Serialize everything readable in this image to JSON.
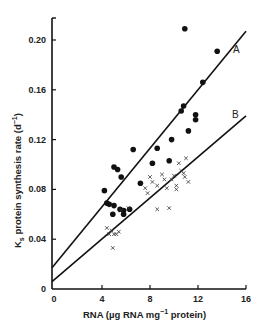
{
  "chart_data": {
    "type": "scatter",
    "title": "",
    "xlabel": "RNA (µg RNA mg⁻¹ protein)",
    "ylabel": "Ks protein synthesis rate (d⁻¹)",
    "xlim": [
      0,
      16
    ],
    "ylim": [
      0,
      0.22
    ],
    "x_ticks": [
      "0",
      "4",
      "8",
      "12",
      "16"
    ],
    "y_ticks": [
      "0",
      "0.04",
      "0.08",
      "0.12",
      "0.16",
      "0.20"
    ],
    "grid": false,
    "legend": "none",
    "series": [
      {
        "name": "dots",
        "marker": "filled-circle",
        "points": [
          [
            4.2,
            0.079
          ],
          [
            4.4,
            0.069
          ],
          [
            4.6,
            0.068
          ],
          [
            5.0,
            0.067
          ],
          [
            4.9,
            0.06
          ],
          [
            5.0,
            0.098
          ],
          [
            5.3,
            0.096
          ],
          [
            5.6,
            0.09
          ],
          [
            5.5,
            0.064
          ],
          [
            5.8,
            0.063
          ],
          [
            5.8,
            0.06
          ],
          [
            6.3,
            0.064
          ],
          [
            6.6,
            0.112
          ],
          [
            7.2,
            0.085
          ],
          [
            8.2,
            0.101
          ],
          [
            8.6,
            0.113
          ],
          [
            9.6,
            0.103
          ],
          [
            9.8,
            0.12
          ],
          [
            10.6,
            0.143
          ],
          [
            10.8,
            0.147
          ],
          [
            10.9,
            0.209
          ],
          [
            11.2,
            0.127
          ],
          [
            11.8,
            0.136
          ],
          [
            11.8,
            0.14
          ],
          [
            12.4,
            0.166
          ],
          [
            13.6,
            0.191
          ]
        ]
      },
      {
        "name": "crosses",
        "marker": "x",
        "points": [
          [
            4.4,
            0.049
          ],
          [
            4.6,
            0.044
          ],
          [
            4.8,
            0.047
          ],
          [
            4.9,
            0.033
          ],
          [
            5.0,
            0.044
          ],
          [
            5.2,
            0.044
          ],
          [
            5.4,
            0.046
          ],
          [
            5.6,
            0.063
          ],
          [
            6.2,
            0.065
          ],
          [
            7.6,
            0.081
          ],
          [
            7.8,
            0.077
          ],
          [
            8.0,
            0.09
          ],
          [
            8.2,
            0.086
          ],
          [
            8.6,
            0.064
          ],
          [
            8.6,
            0.083
          ],
          [
            9.0,
            0.092
          ],
          [
            9.2,
            0.088
          ],
          [
            9.4,
            0.081
          ],
          [
            9.6,
            0.065
          ],
          [
            9.8,
            0.088
          ],
          [
            10.0,
            0.091
          ],
          [
            10.2,
            0.083
          ],
          [
            10.2,
            0.08
          ],
          [
            10.4,
            0.101
          ],
          [
            10.6,
            0.095
          ],
          [
            10.8,
            0.093
          ],
          [
            11.2,
            0.086
          ],
          [
            10.9,
            0.09
          ],
          [
            11.0,
            0.105
          ]
        ]
      }
    ],
    "regression_lines": [
      {
        "name": "A",
        "x": [
          0,
          16
        ],
        "y": [
          0.017,
          0.207
        ]
      },
      {
        "name": "B",
        "x": [
          0,
          16
        ],
        "y": [
          0.006,
          0.139
        ]
      }
    ]
  },
  "labels": {
    "line_a": "A",
    "line_b": "B",
    "xlabel_main": "RNA (µg RNA mg",
    "xlabel_sup": "−1",
    "xlabel_end": " protein)",
    "ylabel_main": "K",
    "ylabel_sub": "s",
    "ylabel_rest": " protein synthesis rate (d",
    "ylabel_sup": "−1",
    "ylabel_end": ")"
  }
}
